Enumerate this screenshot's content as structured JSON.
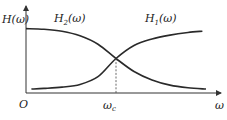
{
  "chart_data": {
    "type": "line",
    "title": "",
    "ylabel": "H(ω)",
    "xlabel": "ω",
    "origin_label": "O",
    "x_tick_labels": [
      {
        "label": "ωc",
        "main": "ω",
        "sub": "c",
        "x": 0.5
      }
    ],
    "xlim": [
      0,
      1
    ],
    "ylim": [
      0,
      1
    ],
    "grid": false,
    "crossover": {
      "x": 0.5,
      "y": 0.5,
      "marker": "dashed vertical line to x-axis"
    },
    "series": [
      {
        "name": "H2(ω)",
        "label_main": "H",
        "label_sub": "2",
        "label_arg": "(ω)",
        "description": "low-pass: starts high, decreases through crossover",
        "x": [
          0.0,
          0.1,
          0.2,
          0.3,
          0.4,
          0.5,
          0.6,
          0.7,
          0.8,
          0.9,
          1.0
        ],
        "values": [
          0.96,
          0.95,
          0.92,
          0.85,
          0.72,
          0.5,
          0.3,
          0.17,
          0.09,
          0.05,
          0.03
        ]
      },
      {
        "name": "H1(ω)",
        "label_main": "H",
        "label_sub": "1",
        "label_arg": "(ω)",
        "description": "high-pass: starts low, increases through crossover",
        "x": [
          0.03,
          0.1,
          0.2,
          0.3,
          0.4,
          0.5,
          0.6,
          0.7,
          0.8,
          0.9,
          0.98
        ],
        "values": [
          0.03,
          0.04,
          0.06,
          0.1,
          0.22,
          0.5,
          0.7,
          0.8,
          0.86,
          0.9,
          0.92
        ]
      }
    ]
  }
}
